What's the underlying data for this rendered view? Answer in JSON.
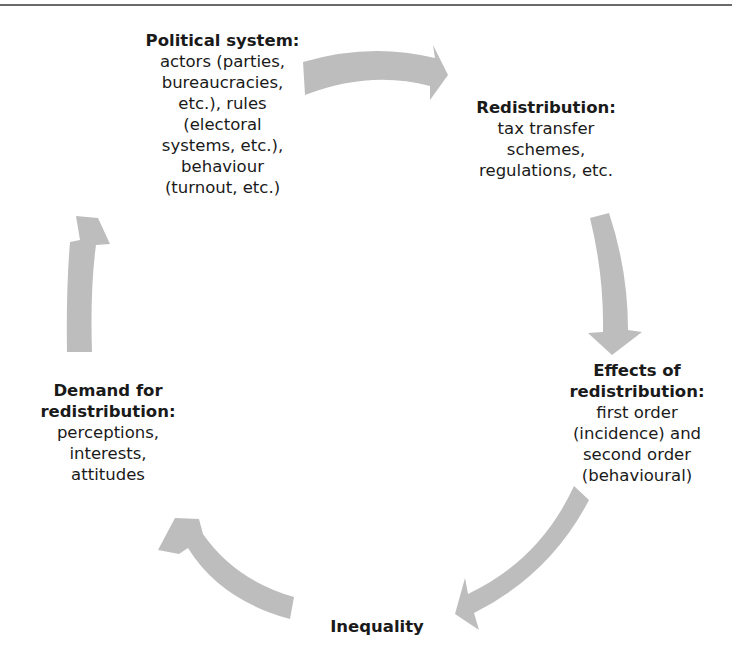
{
  "diagram": {
    "type": "cycle",
    "arrow_color": "#bdbdbd",
    "nodes": [
      {
        "id": "political-system",
        "title": "Political system:",
        "body": "actors (parties,\nbureaucracies,\netc.), rules\n(electoral\nsystems, etc.),\nbehaviour\n(turnout, etc.)"
      },
      {
        "id": "redistribution",
        "title": "Redistribution:",
        "body": "tax transfer\nschemes,\nregulations, etc."
      },
      {
        "id": "effects-of-redistribution",
        "title": "Effects of\nredistribution:",
        "body": "first order\n(incidence) and\nsecond order\n(behavioural)"
      },
      {
        "id": "inequality",
        "title": "Inequality",
        "body": ""
      },
      {
        "id": "demand-for-redistribution",
        "title": "Demand for\nredistribution:",
        "body": "perceptions,\ninterests,\nattitudes"
      }
    ],
    "edges": [
      {
        "from": "political-system",
        "to": "redistribution"
      },
      {
        "from": "redistribution",
        "to": "effects-of-redistribution"
      },
      {
        "from": "effects-of-redistribution",
        "to": "inequality"
      },
      {
        "from": "inequality",
        "to": "demand-for-redistribution"
      },
      {
        "from": "demand-for-redistribution",
        "to": "political-system"
      }
    ]
  }
}
